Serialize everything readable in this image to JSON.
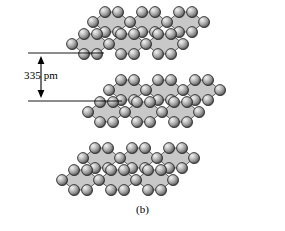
{
  "figure": {
    "caption": "(b)"
  },
  "dimension": {
    "label": "335 pm",
    "value": 335,
    "unit": "pm",
    "description": "interlayer spacing"
  },
  "colors": {
    "sheet_fill": "#c8c8c8",
    "bond_stroke": "#555555",
    "atom_outline": "#2b2b2b",
    "atom_highlight": "#e8e8e8",
    "atom_mid": "#9a9a9a",
    "atom_shadow": "#3a3a3a",
    "annotation": "#000000",
    "background": "#ffffff"
  },
  "layers": [
    {
      "name": "top-layer",
      "atom_count": 22,
      "origin_x": 72,
      "origin_y": 44
    },
    {
      "name": "middle-layer",
      "atom_count": 22,
      "origin_x": 88,
      "origin_y": 112
    },
    {
      "name": "bottom-layer",
      "atom_count": 22,
      "origin_x": 62,
      "origin_y": 180
    }
  ],
  "geometry": {
    "cell_dx": 37,
    "cell_dy": 0,
    "skew_dx": 21,
    "skew_dy": -22,
    "bond_dx": 12,
    "bond_dy": 10,
    "atom_radius": 5.4,
    "columns": 3,
    "rows": 2
  },
  "icons": {
    "arrow_up": "arrow-up-icon",
    "arrow_down": "arrow-down-icon"
  }
}
